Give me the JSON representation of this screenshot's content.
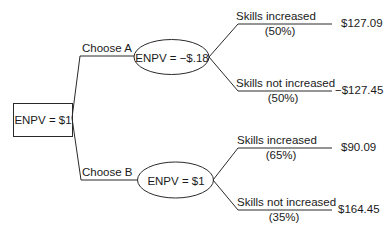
{
  "diagram": {
    "type": "decision-tree",
    "root": {
      "label": "ENPV = $1",
      "shape": "rectangle"
    },
    "choices": [
      {
        "label": "Choose A",
        "node": {
          "label": "ENPV = −$.18",
          "shape": "ellipse"
        },
        "outcomes": [
          {
            "label": "Skills increased",
            "probability": "(50%)",
            "value": "$127.09"
          },
          {
            "label": "Skills not increased",
            "probability": "(50%)",
            "value": "−$127.45"
          }
        ]
      },
      {
        "label": "Choose B",
        "node": {
          "label": "ENPV = $1",
          "shape": "ellipse"
        },
        "outcomes": [
          {
            "label": "Skills increased",
            "probability": "(65%)",
            "value": "$90.09"
          },
          {
            "label": "Skills not increased",
            "probability": "(35%)",
            "value": "$164.45"
          }
        ]
      }
    ]
  },
  "colors": {
    "line": "#2a2a2a",
    "text": "#1a1a1a",
    "background": "#ffffff"
  }
}
